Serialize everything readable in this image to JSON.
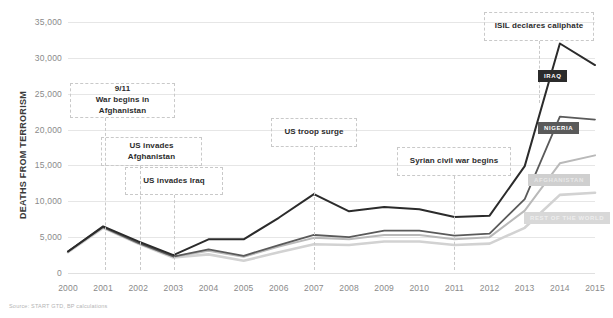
{
  "axis": {
    "y_title": "DEATHS FROM TERRORISM",
    "y_ticks": [
      "35,000",
      "30,000",
      "25,000",
      "20,000",
      "15,000",
      "10,000",
      "5,000",
      "0"
    ],
    "x_ticks": [
      "2000",
      "2001",
      "2002",
      "2003",
      "2004",
      "2005",
      "2006",
      "2007",
      "2008",
      "2009",
      "2010",
      "2011",
      "2012",
      "2013",
      "2014",
      "2015"
    ]
  },
  "source": "Source: START GTD, BP calculations",
  "annotations": [
    {
      "id": "a1",
      "text": "9/11\nWar begins in Afghanistan"
    },
    {
      "id": "a2",
      "text": "US invades Afghanistan"
    },
    {
      "id": "a3",
      "text": "US invades Iraq"
    },
    {
      "id": "a4",
      "text": "US troop surge"
    },
    {
      "id": "a5",
      "text": "Syrian civil war begins"
    },
    {
      "id": "a6",
      "text": "ISIL declares caliphate"
    }
  ],
  "annotation_text": {
    "nine_eleven_line1": "9/11",
    "nine_eleven_line2": "War begins in Afghanistan",
    "us_invades_afghanistan": "US invades Afghanistan",
    "us_invades_iraq": "US invades Iraq",
    "us_troop_surge": "US troop surge",
    "syrian_civil_war": "Syrian civil war begins",
    "isil_caliphate": "ISIL declares caliphate"
  },
  "series_labels": {
    "iraq": "IRAQ",
    "nigeria": "NIGERIA",
    "afghanistan": "AFGHANISTAN",
    "rest_of_world": "REST OF THE WORLD"
  },
  "colors": {
    "iraq": "#2b2b2b",
    "nigeria": "#5a5a5a",
    "afghanistan": "#b9b9b9",
    "rest_of_world": "#d2d2d2",
    "grid": "#e6e6e6",
    "annotation_border": "#c9c9c9"
  },
  "chart_data": {
    "type": "line",
    "title": "",
    "xlabel": "",
    "ylabel": "DEATHS FROM TERRORISM",
    "ylim": [
      0,
      35000
    ],
    "xlim": [
      "2000",
      "2015"
    ],
    "grid": true,
    "legend": "inline-end-labels",
    "stacked_cumulative": true,
    "x": [
      2000,
      2001,
      2002,
      2003,
      2004,
      2005,
      2006,
      2007,
      2008,
      2009,
      2010,
      2011,
      2012,
      2013,
      2014,
      2015
    ],
    "series": [
      {
        "name": "IRAQ",
        "color": "#2b2b2b",
        "note": "topmost cumulative line (world total)",
        "values": [
          3000,
          6500,
          4400,
          2500,
          4700,
          4700,
          7700,
          11000,
          8600,
          9200,
          8900,
          7800,
          8000,
          14900,
          32000,
          29000
        ]
      },
      {
        "name": "NIGERIA",
        "color": "#5a5a5a",
        "note": "second cumulative line",
        "values": [
          3000,
          6400,
          4200,
          2300,
          3300,
          2400,
          3900,
          5300,
          5000,
          5900,
          5900,
          5200,
          5500,
          10300,
          21800,
          21400
        ]
      },
      {
        "name": "AFGHANISTAN",
        "color": "#b9b9b9",
        "note": "third cumulative line",
        "values": [
          2950,
          6350,
          4150,
          2250,
          3100,
          2250,
          3700,
          4900,
          4700,
          5300,
          5300,
          4700,
          5000,
          8700,
          15300,
          16400
        ]
      },
      {
        "name": "REST OF THE WORLD",
        "color": "#d2d2d2",
        "note": "lowest cumulative line",
        "values": [
          2900,
          6300,
          4100,
          2150,
          2600,
          1700,
          2900,
          4000,
          3900,
          4400,
          4400,
          3900,
          4100,
          6300,
          10900,
          11200
        ]
      }
    ]
  }
}
